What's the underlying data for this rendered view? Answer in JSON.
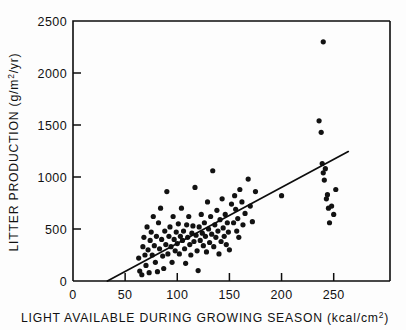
{
  "figure": {
    "background_color": "#ffffff",
    "ink_color": "#111111"
  },
  "chart_data": {
    "type": "scatter",
    "title": "",
    "xlabel": "LIGHT AVAILABLE DURING GROWING SEASON (kcal/cm2)",
    "xlabel_main": "LIGHT AVAILABLE DURING GROWING SEASON",
    "xlabel_units_pre": "(kcal/cm",
    "xlabel_units_sup": "2",
    "xlabel_units_post": ")",
    "ylabel": "LITTER PRODUCTION (g/m2/yr)",
    "ylabel_main": "LITTER PRODUCTION (g/m",
    "ylabel_sup": "2",
    "ylabel_post": "/yr)",
    "xlim": [
      0,
      304
    ],
    "ylim": [
      0,
      2500
    ],
    "xticks": [
      0,
      50,
      100,
      150,
      200,
      250
    ],
    "xtick_labels": [
      "0",
      "50",
      "100",
      "150",
      "200",
      "250"
    ],
    "yticks": [
      0,
      500,
      1000,
      1500,
      2000,
      2500
    ],
    "ytick_labels": [
      "0",
      "500",
      "1000",
      "1500",
      "2000",
      "2500"
    ],
    "grid": false,
    "legend": "none",
    "marker": "filled-circle",
    "marker_color": "#121212",
    "fit_line": {
      "label": "regression line",
      "x_start": 33,
      "y_start": 0,
      "x_end": 264,
      "y_end": 1245,
      "color": "#0d0d0d"
    },
    "points": [
      [
        63,
        220
      ],
      [
        64,
        95
      ],
      [
        66,
        60
      ],
      [
        67,
        330
      ],
      [
        68,
        420
      ],
      [
        69,
        250
      ],
      [
        70,
        150
      ],
      [
        71,
        520
      ],
      [
        72,
        300
      ],
      [
        73,
        80
      ],
      [
        74,
        390
      ],
      [
        75,
        470
      ],
      [
        76,
        250
      ],
      [
        77,
        620
      ],
      [
        78,
        340
      ],
      [
        79,
        180
      ],
      [
        80,
        430
      ],
      [
        81,
        90
      ],
      [
        82,
        560
      ],
      [
        83,
        310
      ],
      [
        84,
        700
      ],
      [
        85,
        400
      ],
      [
        86,
        240
      ],
      [
        87,
        120
      ],
      [
        88,
        480
      ],
      [
        89,
        350
      ],
      [
        90,
        860
      ],
      [
        91,
        260
      ],
      [
        92,
        430
      ],
      [
        93,
        520
      ],
      [
        94,
        330
      ],
      [
        95,
        180
      ],
      [
        96,
        620
      ],
      [
        97,
        400
      ],
      [
        98,
        290
      ],
      [
        99,
        470
      ],
      [
        100,
        360
      ],
      [
        101,
        550
      ],
      [
        102,
        260
      ],
      [
        103,
        430
      ],
      [
        104,
        700
      ],
      [
        105,
        390
      ],
      [
        106,
        480
      ],
      [
        107,
        310
      ],
      [
        108,
        170
      ],
      [
        109,
        540
      ],
      [
        110,
        420
      ],
      [
        111,
        620
      ],
      [
        112,
        350
      ],
      [
        113,
        250
      ],
      [
        114,
        460
      ],
      [
        115,
        530
      ],
      [
        116,
        380
      ],
      [
        117,
        900
      ],
      [
        118,
        440
      ],
      [
        119,
        290
      ],
      [
        120,
        100
      ],
      [
        121,
        520
      ],
      [
        122,
        390
      ],
      [
        123,
        640
      ],
      [
        124,
        460
      ],
      [
        125,
        340
      ],
      [
        126,
        560
      ],
      [
        127,
        430
      ],
      [
        128,
        280
      ],
      [
        129,
        760
      ],
      [
        130,
        500
      ],
      [
        131,
        370
      ],
      [
        132,
        620
      ],
      [
        133,
        450
      ],
      [
        134,
        1060
      ],
      [
        135,
        330
      ],
      [
        136,
        540
      ],
      [
        137,
        420
      ],
      [
        138,
        680
      ],
      [
        139,
        480
      ],
      [
        140,
        260
      ],
      [
        141,
        590
      ],
      [
        142,
        380
      ],
      [
        143,
        790
      ],
      [
        144,
        510
      ],
      [
        145,
        430
      ],
      [
        146,
        640
      ],
      [
        147,
        350
      ],
      [
        148,
        560
      ],
      [
        149,
        470
      ],
      [
        150,
        300
      ],
      [
        152,
        740
      ],
      [
        154,
        560
      ],
      [
        155,
        820
      ],
      [
        156,
        690
      ],
      [
        157,
        480
      ],
      [
        158,
        600
      ],
      [
        159,
        420
      ],
      [
        160,
        880
      ],
      [
        162,
        760
      ],
      [
        163,
        540
      ],
      [
        165,
        650
      ],
      [
        168,
        980
      ],
      [
        170,
        720
      ],
      [
        172,
        570
      ],
      [
        175,
        860
      ],
      [
        200,
        820
      ],
      [
        236,
        1540
      ],
      [
        238,
        1430
      ],
      [
        239,
        1130
      ],
      [
        240,
        1040
      ],
      [
        240,
        2300
      ],
      [
        241,
        970
      ],
      [
        242,
        1080
      ],
      [
        243,
        790
      ],
      [
        244,
        830
      ],
      [
        245,
        700
      ],
      [
        246,
        560
      ],
      [
        248,
        720
      ],
      [
        250,
        640
      ],
      [
        252,
        880
      ]
    ]
  }
}
